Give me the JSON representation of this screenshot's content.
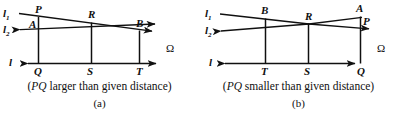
{
  "figure": {
    "type": "geometric-construction-diagram",
    "panel_count": 2,
    "line_color": "#101010"
  },
  "panels": [
    {
      "id": "a",
      "sub_label": "(a)",
      "caption_open": "(",
      "caption_italic": "PQ",
      "caption_rest": " larger than given distance)",
      "caption_full": "(PQ larger than given distance)",
      "axis_label": "l",
      "line1_label": "l",
      "line1_sub": "1",
      "line2_label": "l",
      "line2_sub": "2",
      "omega": "Ω",
      "top_points": [
        {
          "name": "P",
          "label": "P"
        },
        {
          "name": "A",
          "label": "A"
        },
        {
          "name": "R",
          "label": "R"
        },
        {
          "name": "B",
          "label": "B"
        }
      ],
      "base_points": [
        {
          "name": "Q",
          "label": "Q"
        },
        {
          "name": "S",
          "label": "S"
        },
        {
          "name": "T",
          "label": "T"
        }
      ]
    },
    {
      "id": "b",
      "sub_label": "(b)",
      "caption_open": "(",
      "caption_italic": "PQ",
      "caption_rest": " smaller than given distance)",
      "caption_full": "(PQ smaller than given distance)",
      "axis_label": "l",
      "line1_label": "l",
      "line1_sub": "1",
      "line2_label": "l",
      "line2_sub": "2",
      "omega": "Ω",
      "top_points": [
        {
          "name": "B",
          "label": "B"
        },
        {
          "name": "R",
          "label": "R"
        },
        {
          "name": "A",
          "label": "A"
        },
        {
          "name": "P",
          "label": "P"
        }
      ],
      "base_points": [
        {
          "name": "T",
          "label": "T"
        },
        {
          "name": "S",
          "label": "S"
        },
        {
          "name": "Q",
          "label": "Q"
        }
      ]
    }
  ]
}
